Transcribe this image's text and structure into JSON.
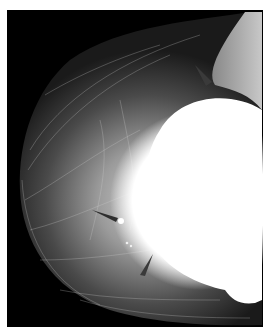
{
  "image": {
    "kind": "mammogram",
    "view": "breast radiograph with implant",
    "colors": {
      "background": "#000000",
      "border": "#ffffff",
      "implant": "#ffffff",
      "tissue_light": "#bdbdbd",
      "tissue_mid": "#6e6e6e",
      "arrow": "#3a3a3a"
    },
    "annotations": [
      {
        "name": "arrowhead-upper",
        "x": 200,
        "y": 72
      },
      {
        "name": "arrowhead-middle",
        "x": 113,
        "y": 218
      },
      {
        "name": "arrowhead-lower",
        "x": 147,
        "y": 265
      }
    ],
    "findings": [
      {
        "name": "calcification-large",
        "x": 121,
        "y": 221
      },
      {
        "name": "calcification-small-1",
        "x": 127,
        "y": 243
      },
      {
        "name": "calcification-small-2",
        "x": 131,
        "y": 246
      }
    ]
  }
}
